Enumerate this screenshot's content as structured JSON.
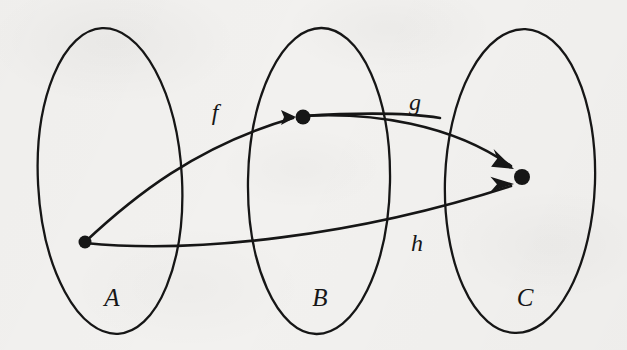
{
  "figure": {
    "background_color": "#f2f1ef",
    "ink_color": "#161616",
    "width": 627,
    "height": 350
  },
  "sets": [
    {
      "id": "A",
      "label": "A",
      "label_x": 112,
      "label_y": 297,
      "cx": 110,
      "cy": 181,
      "rx": 72,
      "ry": 153,
      "rotate": -3
    },
    {
      "id": "B",
      "label": "B",
      "label_x": 320,
      "label_y": 297,
      "cx": 319,
      "cy": 181,
      "rx": 71,
      "ry": 153,
      "rotate": 1
    },
    {
      "id": "C",
      "label": "C",
      "label_x": 525,
      "label_y": 297,
      "cx": 520,
      "cy": 181,
      "rx": 75,
      "ry": 152,
      "rotate": 2
    }
  ],
  "elements": [
    {
      "id": "a",
      "in_set": "A",
      "x": 85,
      "y": 242,
      "r": 6.5
    },
    {
      "id": "b",
      "in_set": "B",
      "x": 303,
      "y": 117,
      "r": 7.5
    },
    {
      "id": "c",
      "in_set": "C",
      "x": 522,
      "y": 177,
      "r": 8.0
    }
  ],
  "arrows": [
    {
      "id": "f",
      "label": "f",
      "label_x": 215,
      "label_y": 112,
      "from": "a",
      "to": "b",
      "from_point": [
        85,
        242
      ],
      "to_point": [
        293,
        117
      ],
      "path": "M 85 242 C 133 197, 196 146, 293 118",
      "tail_path": "M 303 116 C 352 113, 404 112, 440 118"
    },
    {
      "id": "g",
      "label": "g",
      "label_x": 415,
      "label_y": 102,
      "from": "b",
      "to": "c",
      "from_point": [
        303,
        117
      ],
      "to_point": [
        511,
        167
      ],
      "path": "M 303 116 C 372 112, 452 124, 511 166"
    },
    {
      "id": "h",
      "label": "h",
      "label_x": 417,
      "label_y": 243,
      "from": "a",
      "to": "c",
      "from_point": [
        85,
        242
      ],
      "to_point": [
        511,
        185
      ],
      "path": "M 85 243 C 196 254, 356 236, 511 186"
    }
  ]
}
